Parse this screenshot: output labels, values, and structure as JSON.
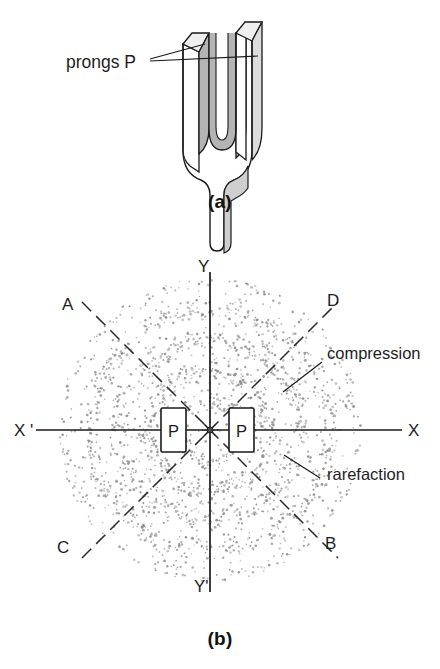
{
  "figure": {
    "panels": [
      {
        "id": "a",
        "caption": "(a)",
        "description": "tuning fork with prongs"
      },
      {
        "id": "b",
        "caption": "(b)",
        "description": "compressions and rarefactions around vibrating prongs"
      }
    ]
  },
  "panel_a": {
    "caption": "(a)",
    "annotation": "prongs P",
    "fork": {
      "face_color": "#ffffff",
      "shade_color": "#b8b8b8",
      "top_color": "#e8e8e8",
      "outline_color": "#1a1a1a"
    }
  },
  "panel_b": {
    "caption": "(b)",
    "axes": {
      "x_positive": "X",
      "x_negative": "X '",
      "y_positive": "Y",
      "y_negative": "Y'"
    },
    "rays": {
      "upper_left": "A",
      "upper_right": "D",
      "lower_left": "C",
      "lower_right": "B"
    },
    "prong_markers": [
      {
        "label": "P",
        "side": "left"
      },
      {
        "label": "P",
        "side": "right"
      }
    ],
    "annotations": [
      {
        "name": "compression",
        "text": "compression"
      },
      {
        "name": "rarefaction",
        "text": "rarefaction"
      }
    ],
    "colors": {
      "dot_color": "#8a8a8a",
      "axis_color": "#1a1a1a",
      "dashed_ray_color": "#2a2a2a"
    }
  },
  "chart_data": {
    "type": "scatter",
    "center": {
      "x": 210,
      "y": 430
    },
    "outer_radius": 152,
    "axis_ranges": {
      "x": [
        -152,
        152
      ],
      "y": [
        -152,
        152
      ]
    },
    "grid": false,
    "legend_position": "right",
    "annotations": [
      "compression",
      "rarefaction"
    ],
    "axis_labels": [
      "X",
      "X '",
      "Y",
      "Y'"
    ],
    "ray_labels": [
      "A",
      "B",
      "C",
      "D"
    ],
    "ray_angles_deg": [
      135,
      315,
      225,
      45
    ],
    "compression_band_radii": [
      28,
      58,
      88,
      118,
      146
    ],
    "rarefaction_band_radii": [
      43,
      73,
      103,
      132
    ],
    "band_spacing": 30,
    "series": [
      {
        "name": "air particles",
        "point_count": 2100,
        "marker": "dot",
        "color": "#8a8a8a"
      }
    ]
  }
}
